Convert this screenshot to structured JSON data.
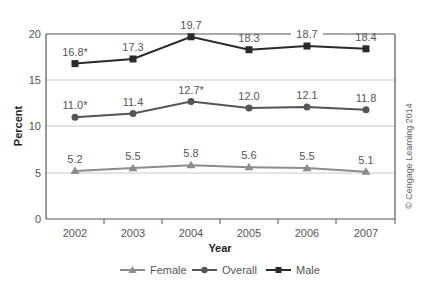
{
  "chart_data": {
    "type": "line",
    "title": "",
    "xlabel": "Year",
    "ylabel": "Percent",
    "ylim": [
      0,
      20
    ],
    "yticks": [
      0,
      5,
      10,
      15,
      20
    ],
    "grid": "horizontal",
    "legend_position": "bottom",
    "categories": [
      "2002",
      "2003",
      "2004",
      "2005",
      "2006",
      "2007"
    ],
    "series": [
      {
        "name": "Female",
        "marker": "triangle",
        "color": "#8c8c8c",
        "values": [
          5.2,
          5.5,
          5.8,
          5.6,
          5.5,
          5.1
        ],
        "labels": [
          "5.2",
          "5.5",
          "5.8",
          "5.6",
          "5.5",
          "5.1"
        ]
      },
      {
        "name": "Overall",
        "marker": "circle",
        "color": "#555555",
        "values": [
          11.0,
          11.4,
          12.7,
          12.0,
          12.1,
          11.8
        ],
        "labels": [
          "11.0*",
          "11.4",
          "12.7*",
          "12.0",
          "12.1",
          "11.8"
        ]
      },
      {
        "name": "Male",
        "marker": "square",
        "color": "#2a2a2a",
        "values": [
          16.8,
          17.3,
          19.7,
          18.3,
          18.7,
          18.4
        ],
        "labels": [
          "16.8*",
          "17.3",
          "19.7",
          "18.3",
          "18.7",
          "18.4"
        ]
      }
    ],
    "annotations": [
      "© Cengage Learning 2014"
    ]
  },
  "legend": {
    "female": "Female",
    "overall": "Overall",
    "male": "Male"
  },
  "axes": {
    "x_title": "Year",
    "y_title": "Percent",
    "y_ticks": [
      "0",
      "5",
      "10",
      "15",
      "20"
    ],
    "x_ticks": [
      "2002",
      "2003",
      "2004",
      "2005",
      "2006",
      "2007"
    ]
  },
  "credit": "© Cengage Learning 2014"
}
